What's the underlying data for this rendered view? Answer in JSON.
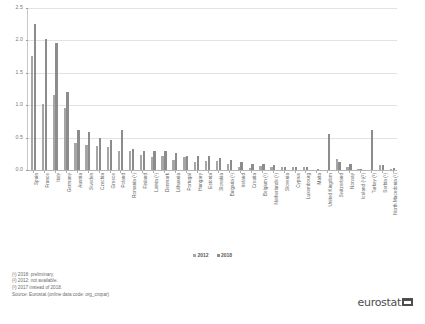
{
  "chart_data": {
    "type": "bar",
    "title": "",
    "xlabel": "",
    "ylabel": "",
    "ylim": [
      0.0,
      2.5
    ],
    "ytick_labels": [
      "0.0",
      "0.5",
      "1.0",
      "1.5",
      "2.0",
      "2.5"
    ],
    "ytick_values": [
      0.0,
      0.5,
      1.0,
      1.5,
      2.0,
      2.5
    ],
    "grid": true,
    "legend_position": "bottom-center",
    "categories": [
      "Spain",
      "France",
      "Italy",
      "Germany",
      "Austria",
      "Sweden",
      "Czechia",
      "Greece",
      "Poland",
      "Romania (¹)",
      "Finland",
      "Latvia (¹)",
      "Denmark",
      "Lithuania",
      "Portugal",
      "Hungary",
      "Estonia",
      "Slovakia",
      "Bulgaria (¹)",
      "Ireland",
      "Croatia",
      "Belgium (¹)",
      "Netherlands (¹)",
      "Slovenia",
      "Cyprus",
      "Luxembourg",
      "Malta",
      "United Kingdom",
      "Switzerland",
      "Norway",
      "Iceland (¹)(²)",
      "Turkey (³)",
      "Serbia (¹)",
      "North Macedonia (¹)"
    ],
    "series": [
      {
        "name": "2012",
        "color": "#a6a6a6",
        "values": [
          1.76,
          1.02,
          1.16,
          0.95,
          0.41,
          0.38,
          0.37,
          0.36,
          0.29,
          0.3,
          0.23,
          0.2,
          0.21,
          0.16,
          0.2,
          0.13,
          0.14,
          0.14,
          0.09,
          0.05,
          0.03,
          0.06,
          0.05,
          0.04,
          0.04,
          0.04,
          0.0,
          null,
          0.17,
          0.05,
          0.02,
          null,
          0.08,
          0.01
        ]
      },
      {
        "name": "2018",
        "color": "#8c8c8c",
        "values": [
          2.25,
          2.02,
          1.96,
          1.21,
          0.61,
          0.58,
          0.49,
          0.47,
          0.62,
          0.33,
          0.3,
          0.3,
          0.29,
          0.26,
          0.22,
          0.22,
          0.21,
          0.19,
          0.16,
          0.12,
          0.1,
          0.09,
          0.07,
          0.05,
          0.05,
          0.04,
          0.01,
          0.55,
          0.12,
          0.09,
          0.02,
          0.62,
          0.07,
          0.03
        ]
      }
    ]
  },
  "legend": {
    "items": [
      {
        "label": "2012",
        "color": "#a6a6a6"
      },
      {
        "label": "2018",
        "color": "#8c8c8c"
      }
    ]
  },
  "footnotes": [
    "(¹) 2018: preliminary.",
    "(²) 2012: not available.",
    "(³) 2017 instead of 2018."
  ],
  "source": "Source: Eurostat (online data code: org_cropar)",
  "logo": {
    "text": "eurostat"
  }
}
